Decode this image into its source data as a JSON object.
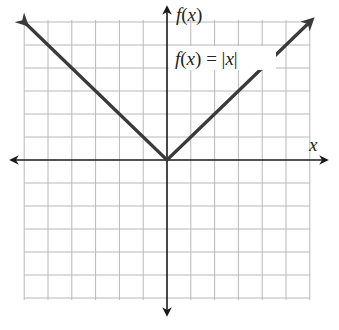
{
  "chart_data": {
    "type": "line",
    "title": "",
    "function_label": "f(x) = |x|",
    "xlabel": "x",
    "ylabel": "f(x)",
    "xlim": [
      -6,
      6
    ],
    "ylim": [
      -6,
      6
    ],
    "grid": true,
    "grid_step": 1,
    "tick_labels": false,
    "series": [
      {
        "name": "f(x) = |x|",
        "x": [
          -6,
          -5,
          -4,
          -3,
          -2,
          -1,
          0,
          1,
          2,
          3,
          4,
          5,
          6
        ],
        "y": [
          6,
          5,
          4,
          3,
          2,
          1,
          0,
          1,
          2,
          3,
          4,
          5,
          6
        ],
        "arrows_at_ends": true
      }
    ],
    "axes_arrows": true
  },
  "labels": {
    "y_axis_f": "f",
    "y_axis_paren_open": "(",
    "y_axis_x": "x",
    "y_axis_paren_close": ")",
    "x_axis": "x",
    "fn_f": "f",
    "fn_open": "(",
    "fn_x": "x",
    "fn_close": ")",
    "fn_eq": " = ",
    "fn_bar_l": "|",
    "fn_abs_x": "x",
    "fn_bar_r": "|"
  },
  "colors": {
    "grid": "#b8b8b8",
    "axis": "#1a1a1a",
    "function": "#3a3a3a",
    "background": "#ffffff"
  }
}
